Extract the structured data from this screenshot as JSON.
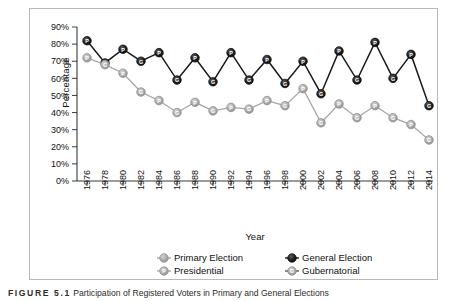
{
  "figure": {
    "caption_label": "FIGURE 5.1",
    "caption_text": "Participation of Registered Voters in Primary and General Elections"
  },
  "chart_data": {
    "type": "line",
    "title": "",
    "xlabel": "Year",
    "ylabel": "Percentage",
    "ylim": [
      0,
      90
    ],
    "ytick_labels": [
      "0%",
      "10%",
      "20%",
      "30%",
      "40%",
      "50%",
      "60%",
      "70%",
      "80%",
      "90%"
    ],
    "ytick_values": [
      0,
      10,
      20,
      30,
      40,
      50,
      60,
      70,
      80,
      90
    ],
    "grid": false,
    "legend_position": "bottom",
    "x": [
      1976,
      1978,
      1980,
      1982,
      1984,
      1986,
      1988,
      1990,
      1992,
      1994,
      1996,
      1998,
      2000,
      2002,
      2004,
      2006,
      2008,
      2010,
      2012,
      2014
    ],
    "xtick_labels": [
      "1976",
      "1978",
      "1980",
      "1982",
      "1984",
      "1986",
      "1988",
      "1990",
      "1992",
      "1994",
      "1996",
      "1998",
      "2000",
      "2002",
      "2004",
      "2006",
      "2008",
      "2010",
      "2012",
      "2014"
    ],
    "series": [
      {
        "name": "General Election",
        "color": "#1a1a1a",
        "values": [
          82,
          69,
          77,
          70,
          75,
          59,
          72,
          58,
          75,
          59,
          71,
          57,
          70,
          51,
          76,
          59,
          81,
          60,
          74,
          44
        ],
        "point_types": [
          "P",
          "G",
          "P",
          "G",
          "P",
          "G",
          "P",
          "G",
          "P",
          "G",
          "P",
          "G",
          "P",
          "G",
          "P",
          "G",
          "P",
          "G",
          "P",
          "G"
        ]
      },
      {
        "name": "Primary Election",
        "color": "#a8a8a8",
        "values": [
          72,
          68,
          63,
          52,
          47,
          40,
          46,
          41,
          43,
          42,
          47,
          44,
          54,
          34,
          45,
          37,
          44,
          37,
          33,
          24
        ],
        "point_types": [
          "P",
          "G",
          "P",
          "G",
          "P",
          "G",
          "P",
          "G",
          "P",
          "G",
          "P",
          "G",
          "P",
          "G",
          "P",
          "G",
          "P",
          "G",
          "P",
          "G"
        ]
      }
    ],
    "legend": [
      {
        "label": "Primary Election",
        "color": "#a8a8a8",
        "letter": "",
        "marker": "filled-circle-gray"
      },
      {
        "label": "General Election",
        "color": "#1a1a1a",
        "letter": "",
        "marker": "filled-circle-black"
      },
      {
        "label": "Presidential",
        "color": "#a8a8a8",
        "letter": "P",
        "marker": "circle-letter-p"
      },
      {
        "label": "Gubernatorial",
        "color": "#555555",
        "letter": "G",
        "marker": "circle-letter-g"
      }
    ]
  }
}
